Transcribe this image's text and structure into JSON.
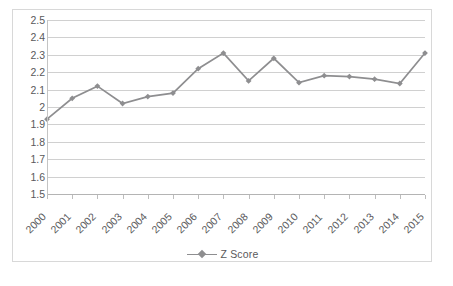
{
  "chart_data": {
    "type": "line",
    "title": "",
    "subtitle": "",
    "xlabel": "",
    "ylabel": "",
    "categories": [
      "2000",
      "2001",
      "2002",
      "2003",
      "2004",
      "2005",
      "2006",
      "2007",
      "2008",
      "2009",
      "2010",
      "2011",
      "2012",
      "2013",
      "2014",
      "2015"
    ],
    "series": [
      {
        "name": "Z Score",
        "values": [
          1.93,
          2.05,
          2.12,
          2.02,
          2.06,
          2.08,
          2.22,
          2.31,
          2.15,
          2.28,
          2.14,
          2.18,
          2.175,
          2.16,
          2.135,
          2.31
        ],
        "color": "#8e8e90",
        "marker": "diamond"
      }
    ],
    "ylim": [
      1.5,
      2.5
    ],
    "ytick_step": 0.1,
    "ytick_labels": [
      "2.5",
      "2.4",
      "2.3",
      "2.2",
      "2.1",
      "2",
      "1.9",
      "1.8",
      "1.7",
      "1.6",
      "1.5"
    ],
    "ytick_values": [
      2.5,
      2.4,
      2.3,
      2.2,
      2.1,
      2.0,
      1.9,
      1.8,
      1.7,
      1.6,
      1.5
    ],
    "grid": true,
    "grid_axis": "y",
    "legend": true,
    "legend_position": "bottom",
    "xtick_rotation": -45,
    "plot_background": "#ffffff",
    "gridline_color": "#d0d0d0",
    "axis_color": "#c4c4c4",
    "text_color": "#59595b",
    "border_color": "#d8d8d8"
  },
  "legend": {
    "entries": [
      {
        "label": "Z Score"
      }
    ]
  }
}
